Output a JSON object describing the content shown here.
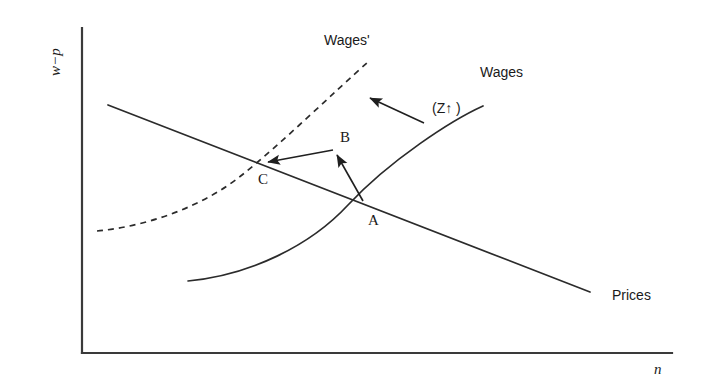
{
  "figure": {
    "type": "economics-diagram",
    "background_color": "#ffffff",
    "line_color": "#2b2b2b",
    "text_color": "#1a1a1a"
  },
  "axes": {
    "y_label": "w−p",
    "x_label": "n",
    "origin": {
      "x": 82,
      "y": 353
    },
    "y_top": {
      "x": 82,
      "y": 28
    },
    "x_right": {
      "x": 672,
      "y": 353
    }
  },
  "curves": {
    "prices": {
      "label": "Prices",
      "style": "solid",
      "description": "downward sloping price-setting line",
      "start": {
        "x": 108,
        "y": 105
      },
      "end": {
        "x": 590,
        "y": 292
      },
      "label_pos": {
        "x": 612,
        "y": 288
      }
    },
    "wages": {
      "label": "Wages",
      "style": "solid",
      "description": "upward sloping wage-setting curve",
      "start": {
        "x": 188,
        "y": 281
      },
      "end": {
        "x": 483,
        "y": 106
      },
      "label_pos": {
        "x": 480,
        "y": 72
      }
    },
    "wages_prime": {
      "label": "Wages'",
      "style": "dashed",
      "description": "shifted wage-setting curve after increase in Z",
      "start": {
        "x": 97,
        "y": 231
      },
      "end": {
        "x": 368,
        "y": 62
      },
      "label_pos": {
        "x": 324,
        "y": 40
      }
    }
  },
  "points": [
    {
      "id": "A",
      "label": "A",
      "x": 365,
      "y": 206,
      "label_pos": {
        "x": 368,
        "y": 218
      },
      "description": "initial equilibrium: Wages meets Prices"
    },
    {
      "id": "B",
      "label": "B",
      "x": 338,
      "y": 153,
      "label_pos": {
        "x": 340,
        "y": 134
      },
      "description": "intermediate point on shifted wage curve"
    },
    {
      "id": "C",
      "label": "C",
      "x": 265,
      "y": 163,
      "label_pos": {
        "x": 258,
        "y": 177
      },
      "description": "new equilibrium: Wages' meets Prices"
    }
  ],
  "arrows": [
    {
      "name": "arrow-a-to-b",
      "from": {
        "x": 363,
        "y": 201
      },
      "to": {
        "x": 337,
        "y": 155
      }
    },
    {
      "name": "arrow-b-to-c",
      "from": {
        "x": 333,
        "y": 150
      },
      "to": {
        "x": 268,
        "y": 162
      }
    },
    {
      "name": "arrow-shift-indicator",
      "from": {
        "x": 424,
        "y": 123
      },
      "to": {
        "x": 370,
        "y": 98
      }
    }
  ],
  "annotations": {
    "shift_cause": "(Z↑ )"
  },
  "annotation_positions": {
    "shift_cause": {
      "x": 432,
      "y": 101
    }
  }
}
